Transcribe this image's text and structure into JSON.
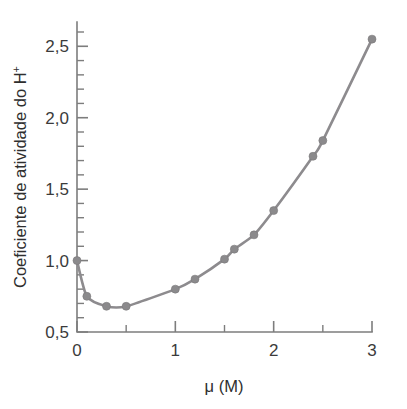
{
  "chart_data": {
    "type": "line",
    "title": "",
    "subtitle": "",
    "xlabel": "μ (M)",
    "ylabel": "Coeficiente de atividade do H⁺",
    "ylabel_base": "Coeficiente de atividade do H",
    "ylabel_superscript": "+",
    "xlim": [
      0,
      3
    ],
    "ylim": [
      0.5,
      2.67
    ],
    "grid": false,
    "legend": null,
    "decimal_separator": ",",
    "x_major_ticks": [
      0,
      1,
      2,
      3
    ],
    "x_major_tick_labels": [
      "0",
      "1",
      "2",
      "3"
    ],
    "x_minor_tick_interval": 0.5,
    "x_minor_ticks": [
      0.5,
      1.5,
      2.5
    ],
    "y_major_ticks": [
      0.5,
      1.0,
      1.5,
      2.0,
      2.5
    ],
    "y_major_tick_labels": [
      "0,5",
      "1,0",
      "1,5",
      "2,0",
      "2,5"
    ],
    "y_minor_tick_interval": 0.1,
    "y_minor_ticks": [
      0.6,
      0.7,
      0.8,
      0.9,
      1.1,
      1.2,
      1.3,
      1.4,
      1.6,
      1.7,
      1.8,
      1.9,
      2.1,
      2.2,
      2.3,
      2.4,
      2.6
    ],
    "series": [
      {
        "name": "Coeficiente de atividade do H+",
        "marker": "filled-circle",
        "color": "#8b8a8c",
        "line_color": "#8d8b8e",
        "x": [
          0.0,
          0.1,
          0.3,
          0.5,
          1.0,
          1.2,
          1.5,
          1.6,
          1.8,
          2.0,
          2.4,
          2.5,
          3.0
        ],
        "y": [
          1.0,
          0.75,
          0.68,
          0.68,
          0.8,
          0.87,
          1.01,
          1.08,
          1.18,
          1.35,
          1.73,
          1.84,
          2.55
        ],
        "points": [
          {
            "x": 0.0,
            "y": 1.0
          },
          {
            "x": 0.1,
            "y": 0.75
          },
          {
            "x": 0.3,
            "y": 0.68
          },
          {
            "x": 0.5,
            "y": 0.68
          },
          {
            "x": 1.0,
            "y": 0.8
          },
          {
            "x": 1.2,
            "y": 0.87
          },
          {
            "x": 1.5,
            "y": 1.01
          },
          {
            "x": 1.6,
            "y": 1.08
          },
          {
            "x": 1.8,
            "y": 1.18
          },
          {
            "x": 2.0,
            "y": 1.35
          },
          {
            "x": 2.4,
            "y": 1.73
          },
          {
            "x": 2.5,
            "y": 1.84
          },
          {
            "x": 3.0,
            "y": 2.55
          }
        ]
      }
    ],
    "colors": {
      "curve": "#8d8b8e",
      "marker": "#8b8a8c",
      "axis": "#7d7d7d",
      "text": "#2e2e2e",
      "background": "#ffffff"
    }
  }
}
